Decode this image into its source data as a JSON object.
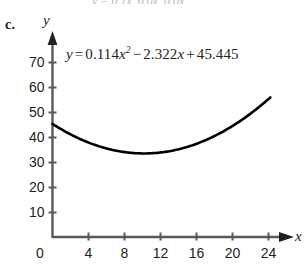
{
  "part": {
    "label": "c."
  },
  "clipped_text": "y = 0.1x, 0.0x, 0.0x",
  "equation": {
    "lhs": "y",
    "equals": "=",
    "a_coefficient": "0.114",
    "a_variable": "x",
    "a_exponent": "2",
    "sign1": "−",
    "b_coefficient": "2.322",
    "b_variable": "x",
    "sign2": "+",
    "c_constant": "45.445",
    "full_text": "y = 0.114x² − 2.322x + 45.445"
  },
  "axes": {
    "x_label": "x",
    "y_label": "y",
    "origin_label": "0"
  },
  "chart_data": {
    "type": "line",
    "title": "",
    "subtitle": "",
    "xlabel": "x",
    "ylabel": "y",
    "equation": "y = 0.114x^2 - 2.322x + 45.445",
    "coefficients": {
      "a": 0.114,
      "b": -2.322,
      "c": 45.445
    },
    "vertex": {
      "x": 10.18,
      "y": 33.62
    },
    "xlim": [
      0,
      26
    ],
    "ylim": [
      0,
      75
    ],
    "xticks": [
      0,
      4,
      8,
      12,
      16,
      20,
      24
    ],
    "yticks": [
      10,
      20,
      30,
      40,
      50,
      60,
      70
    ],
    "xtick_labels": [
      "0",
      "4",
      "8",
      "12",
      "16",
      "20",
      "24"
    ],
    "ytick_labels": [
      "10",
      "20",
      "30",
      "40",
      "50",
      "60",
      "70"
    ],
    "grid": false,
    "legend": null,
    "curve_domain": [
      0,
      24.2
    ],
    "series": [
      {
        "name": "y = 0.114x^2 - 2.322x + 45.445",
        "x": [
          0,
          2,
          4,
          6,
          8,
          10,
          12,
          14,
          16,
          18,
          20,
          22,
          24
        ],
        "values": [
          45.4,
          41.3,
          38.0,
          35.6,
          34.2,
          33.6,
          34.0,
          35.3,
          37.5,
          40.6,
          44.6,
          49.6,
          55.4
        ]
      }
    ]
  }
}
